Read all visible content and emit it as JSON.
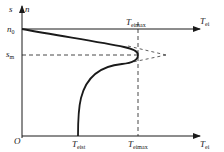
{
  "diagram": {
    "type": "torque-slip characteristic",
    "colors": {
      "ink": "#1a1a1a",
      "background": "#ffffff"
    },
    "axes": {
      "vertical": {
        "label_s": "s",
        "label_n": "n"
      },
      "horizontal_top": {
        "label_main": "T",
        "label_sub": "ei"
      },
      "horizontal_bottom": {
        "label_main": "T",
        "label_sub": "ei"
      },
      "origin": "O"
    },
    "markers": {
      "n0": {
        "main": "n",
        "sub": "0"
      },
      "sm": {
        "main": "s",
        "sub": "m"
      },
      "temax_top": {
        "main": "T",
        "sub": "eimax"
      },
      "temax_bottom": {
        "main": "T",
        "sub": "eimax"
      },
      "teist": {
        "main": "T",
        "sub": "eist"
      }
    }
  }
}
